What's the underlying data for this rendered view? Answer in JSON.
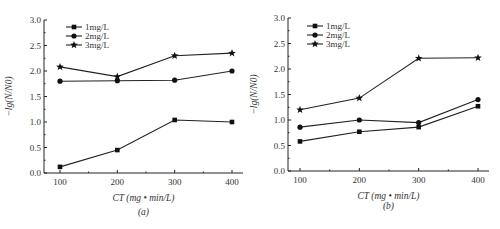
{
  "chart_data": [
    {
      "type": "line",
      "panel_label": "(a)",
      "xlabel": "CT (mg • min/L)",
      "ylabel": "−lg(N/N0)",
      "x": [
        100,
        200,
        300,
        400
      ],
      "xticks": [
        "100",
        "200",
        "300",
        "400"
      ],
      "yticks": [
        "0.0",
        "0.5",
        "1.0",
        "1.5",
        "2.0",
        "2.5",
        "3.0"
      ],
      "ylim": [
        0,
        3.0
      ],
      "grid": false,
      "legend_position": "upper left",
      "series": [
        {
          "name": "1mg/L",
          "marker": "square",
          "values": [
            0.12,
            0.45,
            1.04,
            1.0
          ]
        },
        {
          "name": "2mg/L",
          "marker": "circle",
          "values": [
            1.8,
            1.81,
            1.82,
            2.0
          ]
        },
        {
          "name": "3mg/L",
          "marker": "star",
          "values": [
            2.08,
            1.89,
            2.3,
            2.35
          ]
        }
      ]
    },
    {
      "type": "line",
      "panel_label": "(b)",
      "xlabel": "CT (mg • min/L)",
      "ylabel": "−lg(N/N0)",
      "x": [
        100,
        200,
        300,
        400
      ],
      "xticks": [
        "100",
        "200",
        "300",
        "400"
      ],
      "yticks": [
        "0.0",
        "0.5",
        "1.0",
        "1.5",
        "2.0",
        "2.5",
        "3.0"
      ],
      "ylim": [
        0,
        3.0
      ],
      "grid": false,
      "legend_position": "upper left",
      "series": [
        {
          "name": "1mg/L",
          "marker": "square",
          "values": [
            0.58,
            0.77,
            0.86,
            1.27
          ]
        },
        {
          "name": "2mg/L",
          "marker": "circle",
          "values": [
            0.86,
            1.0,
            0.95,
            1.4
          ]
        },
        {
          "name": "3mg/L",
          "marker": "star",
          "values": [
            1.2,
            1.43,
            2.21,
            2.22
          ]
        }
      ]
    }
  ]
}
